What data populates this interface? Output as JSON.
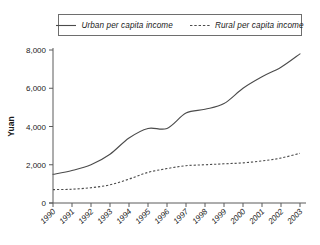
{
  "chart_data": {
    "type": "line",
    "title": "",
    "subtitle": "",
    "xlabel": "",
    "ylabel": "Yuan",
    "x": [
      "1990",
      "1991",
      "1992",
      "1993",
      "1994",
      "1995",
      "1996",
      "1997",
      "1998",
      "1999",
      "2000",
      "2001",
      "2002",
      "2003"
    ],
    "categories": [
      "1990",
      "1991",
      "1992",
      "1993",
      "1994",
      "1995",
      "1996",
      "1997",
      "1998",
      "1999",
      "2000",
      "2001",
      "2002",
      "2003"
    ],
    "xlim": [
      1990,
      2003
    ],
    "ylim": [
      0,
      8000
    ],
    "yticks": [
      0,
      2000,
      4000,
      6000,
      8000
    ],
    "ytick_labels": [
      "0",
      "2,000",
      "4,000",
      "6,000",
      "8,000"
    ],
    "grid": false,
    "legend_position": "top-center",
    "series": [
      {
        "name": "Urban per capita income",
        "style": "solid",
        "color": "#4b4b4b",
        "values": [
          1500,
          1700,
          2000,
          2550,
          3400,
          3900,
          3900,
          4700,
          4900,
          5200,
          6000,
          6600,
          7100,
          7800
        ]
      },
      {
        "name": "Rural per capita income",
        "style": "dashed",
        "color": "#4b4b4b",
        "values": [
          700,
          720,
          800,
          950,
          1250,
          1600,
          1800,
          1950,
          2000,
          2050,
          2100,
          2200,
          2350,
          2600
        ]
      }
    ]
  },
  "legend": {
    "entries": [
      {
        "label": "Urban per capita income",
        "marker": "solid-line-swatch"
      },
      {
        "label": "Rural per capita income",
        "marker": "dashed-line-swatch"
      }
    ]
  },
  "axes": {
    "y_title": "Yuan"
  },
  "colors": {
    "line": "#4b4b4b",
    "axis": "#5a5a5a",
    "text": "#1a1a1a",
    "background": "#ffffff",
    "legend_border": "#6e6e6e"
  }
}
